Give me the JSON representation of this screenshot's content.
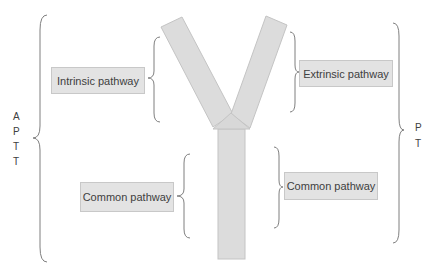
{
  "diagram": {
    "labels": {
      "intrinsic": "Intrinsic pathway",
      "extrinsic": "Extrinsic pathway",
      "common_left": "Common pathway",
      "common_right": "Common pathway"
    },
    "side_labels": {
      "left": [
        "A",
        "P",
        "T",
        "T"
      ],
      "right": [
        "P",
        "T"
      ]
    },
    "colors": {
      "shape_fill": "#dcdcdc",
      "shape_stroke": "#c4c4c4",
      "box_fill": "#e3e3e3",
      "brace_stroke": "#7f7f7f",
      "text": "#404040"
    }
  }
}
